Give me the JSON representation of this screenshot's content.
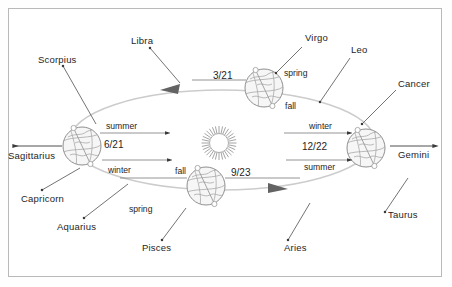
{
  "diagram": {
    "background_color": "#ffffff",
    "border_color": "#b9b9b9",
    "ink_color": "#1e1e1e",
    "orbit_color": "#c9c9c9",
    "globe_fill": "#f4f4f4"
  },
  "sun": {
    "name": "sun-icon",
    "label": ""
  },
  "zodiac": [
    {
      "name": "scorpius",
      "label": "Scorpius",
      "x": 38,
      "y": 58
    },
    {
      "name": "libra",
      "label": "Libra",
      "x": 131,
      "y": 38
    },
    {
      "name": "virgo",
      "label": "Virgo",
      "x": 307,
      "y": 36
    },
    {
      "name": "leo",
      "label": "Leo",
      "x": 352,
      "y": 48
    },
    {
      "name": "cancer",
      "label": "Cancer",
      "x": 399,
      "y": 82
    },
    {
      "name": "gemini",
      "label": "Gemini",
      "x": 400,
      "y": 153
    },
    {
      "name": "taurus",
      "label": "Taurus",
      "x": 389,
      "y": 212
    },
    {
      "name": "aries",
      "label": "Aries",
      "x": 285,
      "y": 246
    },
    {
      "name": "pisces",
      "label": "Pisces",
      "x": 143,
      "y": 246
    },
    {
      "name": "aquarius",
      "label": "Aquarius",
      "x": 58,
      "y": 224
    },
    {
      "name": "capricorn",
      "label": "Capricorn",
      "x": 22,
      "y": 196
    },
    {
      "name": "sagittarius",
      "label": "Sagittarius",
      "x": 8,
      "y": 153
    }
  ],
  "earth_positions": [
    {
      "name": "earth-june",
      "date": "6/21",
      "date_x": 104,
      "date_y": 140,
      "top_season": "summer",
      "top_x": 106,
      "top_y": 124,
      "bottom_season": "winter",
      "bottom_x": 108,
      "bottom_y": 168
    },
    {
      "name": "earth-march",
      "date": "3/21",
      "date_x": 216,
      "date_y": 72,
      "top_season": "spring",
      "top_x": 284,
      "top_y": 71,
      "bottom_season": "fall",
      "bottom_x": 285,
      "bottom_y": 104
    },
    {
      "name": "earth-december",
      "date": "12/22",
      "date_x": 306,
      "date_y": 145,
      "top_season": "winter",
      "top_x": 310,
      "top_y": 124,
      "bottom_season": "summer",
      "bottom_x": 305,
      "bottom_y": 165
    },
    {
      "name": "earth-september",
      "date": "9/23",
      "date_x": 232,
      "date_y": 169,
      "top_season": "fall",
      "top_x": 176,
      "top_y": 169,
      "bottom_season": "spring",
      "bottom_x": 130,
      "bottom_y": 207
    }
  ],
  "direction_arrows": [
    {
      "name": "orbit-arrow-top",
      "direction": "left"
    },
    {
      "name": "orbit-arrow-bottom",
      "direction": "right"
    }
  ],
  "axis_arrows": [
    {
      "name": "sagittarius-arrow",
      "direction": "left"
    },
    {
      "name": "gemini-arrow",
      "direction": "right"
    }
  ]
}
